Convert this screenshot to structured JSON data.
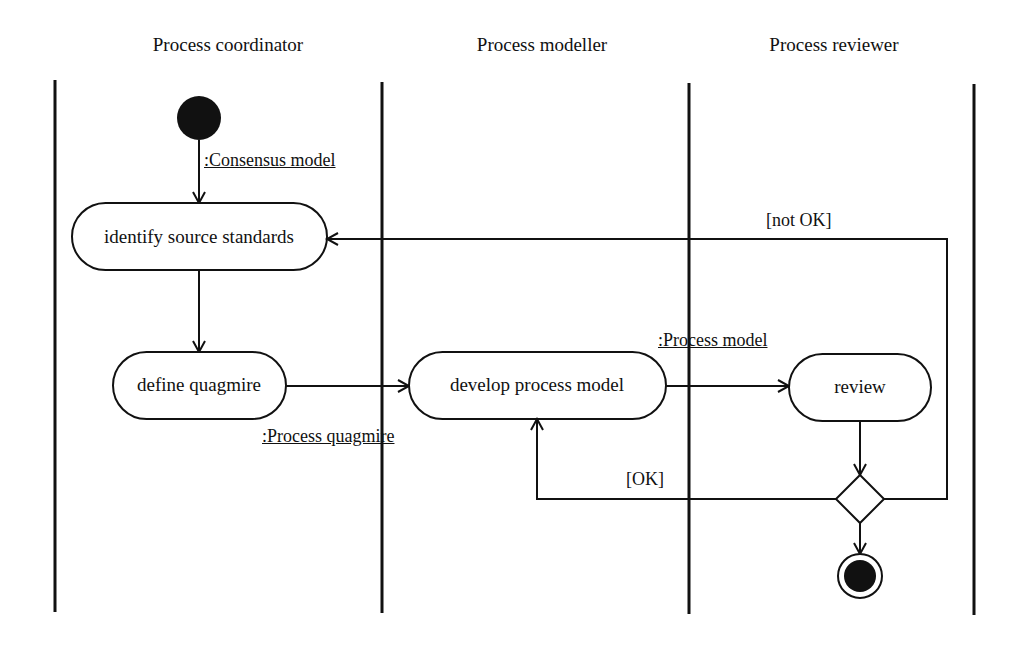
{
  "lanes": [
    {
      "title": "Process coordinator"
    },
    {
      "title": "Process modeller"
    },
    {
      "title": "Process reviewer"
    }
  ],
  "actions": {
    "identify": "identify source standards",
    "define": "define quagmire",
    "develop": "develop process model",
    "review": "review"
  },
  "objects": {
    "consensus": ":Consensus model",
    "quagmire": ":Process quagmire",
    "model": ":Process model"
  },
  "guards": {
    "not_ok": "[not OK]",
    "ok": "[OK]"
  },
  "nodes": {
    "initial": "initial-node",
    "decision": "decision-node",
    "final": "final-node"
  },
  "colors": {
    "line": "#111111",
    "background": "#ffffff"
  }
}
